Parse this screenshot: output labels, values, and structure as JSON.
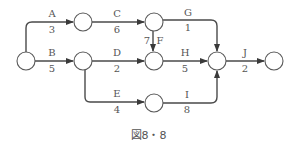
{
  "caption": "図8・8",
  "nodes": [
    {
      "id": "N1",
      "x": 26,
      "y": 61
    },
    {
      "id": "N2",
      "x": 83,
      "y": 22
    },
    {
      "id": "N3",
      "x": 83,
      "y": 61
    },
    {
      "id": "N4",
      "x": 154,
      "y": 22
    },
    {
      "id": "N5",
      "x": 154,
      "y": 61
    },
    {
      "id": "N6",
      "x": 154,
      "y": 102
    },
    {
      "id": "N7",
      "x": 217,
      "y": 61
    },
    {
      "id": "N8",
      "x": 274,
      "y": 61
    }
  ],
  "activities": [
    {
      "name": "A",
      "duration": "3",
      "from": "N1",
      "to": "N2"
    },
    {
      "name": "B",
      "duration": "5",
      "from": "N1",
      "to": "N3"
    },
    {
      "name": "C",
      "duration": "6",
      "from": "N2",
      "to": "N4"
    },
    {
      "name": "D",
      "duration": "2",
      "from": "N3",
      "to": "N5"
    },
    {
      "name": "E",
      "duration": "4",
      "from": "N3",
      "to": "N6"
    },
    {
      "name": "F",
      "duration": "7",
      "from": "N4",
      "to": "N5"
    },
    {
      "name": "G",
      "duration": "1",
      "from": "N4",
      "to": "N7"
    },
    {
      "name": "H",
      "duration": "5",
      "from": "N5",
      "to": "N7"
    },
    {
      "name": "I",
      "duration": "8",
      "from": "N6",
      "to": "N7"
    },
    {
      "name": "J",
      "duration": "2",
      "from": "N7",
      "to": "N8"
    }
  ]
}
